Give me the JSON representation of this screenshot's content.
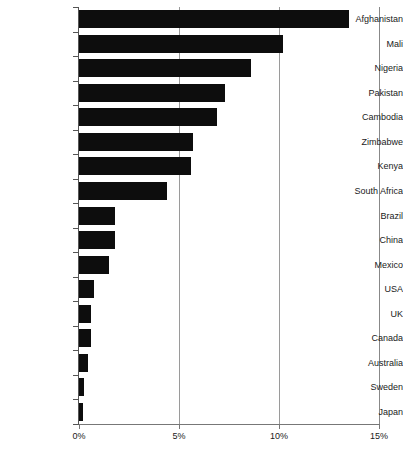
{
  "chart_data": {
    "type": "bar",
    "orientation": "horizontal",
    "title": "",
    "subtitle": "",
    "xlabel": "",
    "ylabel": "",
    "xlim": [
      0,
      15
    ],
    "xunit": "%",
    "grid": "vertical",
    "legend": "none",
    "bar_color": "#0d0d0d",
    "xticks": [
      {
        "value": 0,
        "label": "0%"
      },
      {
        "value": 5,
        "label": "5%"
      },
      {
        "value": 10,
        "label": "10%"
      },
      {
        "value": 15,
        "label": "15%"
      }
    ],
    "categories": [
      "Afghanistan",
      "Mali",
      "Nigeria",
      "Pakistan",
      "Cambodia",
      "Zimbabwe",
      "Kenya",
      "South Africa",
      "Brazil",
      "China",
      "Mexico",
      "USA",
      "UK",
      "Canada",
      "Australia",
      "Sweden",
      "Japan"
    ],
    "values": [
      13.5,
      10.2,
      8.6,
      7.3,
      6.9,
      5.7,
      5.6,
      4.4,
      1.8,
      1.8,
      1.5,
      0.75,
      0.6,
      0.6,
      0.45,
      0.25,
      0.2
    ]
  }
}
